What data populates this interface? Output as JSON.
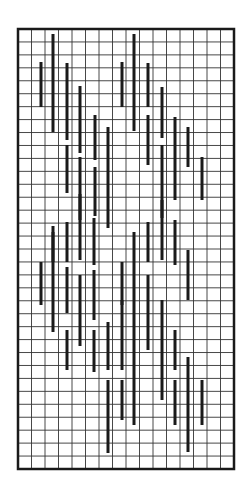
{
  "chart_data": {
    "type": "diagram",
    "title": "",
    "grid": {
      "x0": 18,
      "y0": 29,
      "x1": 234,
      "y1": 469,
      "columns": 16,
      "rows": 34,
      "line_color": "#333333",
      "border_color": "#1a1a1a"
    },
    "bar_color": "#1a1a1a",
    "bars": [
      {
        "x": 41,
        "y1": 62,
        "y2": 107
      },
      {
        "x": 53,
        "y1": 34,
        "y2": 132
      },
      {
        "x": 67,
        "y1": 63,
        "y2": 140
      },
      {
        "x": 67,
        "y1": 145,
        "y2": 193
      },
      {
        "x": 80,
        "y1": 86,
        "y2": 153
      },
      {
        "x": 80,
        "y1": 157,
        "y2": 220
      },
      {
        "x": 95,
        "y1": 115,
        "y2": 160
      },
      {
        "x": 95,
        "y1": 167,
        "y2": 216
      },
      {
        "x": 108,
        "y1": 127,
        "y2": 228
      },
      {
        "x": 122,
        "y1": 62,
        "y2": 107
      },
      {
        "x": 134,
        "y1": 34,
        "y2": 131
      },
      {
        "x": 148,
        "y1": 63,
        "y2": 107
      },
      {
        "x": 148,
        "y1": 115,
        "y2": 165
      },
      {
        "x": 162,
        "y1": 87,
        "y2": 138
      },
      {
        "x": 162,
        "y1": 145,
        "y2": 218
      },
      {
        "x": 175,
        "y1": 117,
        "y2": 200
      },
      {
        "x": 188,
        "y1": 127,
        "y2": 167
      },
      {
        "x": 202,
        "y1": 157,
        "y2": 200
      },
      {
        "x": 53,
        "y1": 226,
        "y2": 262
      },
      {
        "x": 67,
        "y1": 222,
        "y2": 262
      },
      {
        "x": 67,
        "y1": 267,
        "y2": 313
      },
      {
        "x": 80,
        "y1": 194,
        "y2": 260
      },
      {
        "x": 80,
        "y1": 275,
        "y2": 346
      },
      {
        "x": 94,
        "y1": 218,
        "y2": 265
      },
      {
        "x": 41,
        "y1": 262,
        "y2": 305
      },
      {
        "x": 53,
        "y1": 232,
        "y2": 332
      },
      {
        "x": 94,
        "y1": 330,
        "y2": 372
      },
      {
        "x": 108,
        "y1": 322,
        "y2": 370
      },
      {
        "x": 108,
        "y1": 380,
        "y2": 453
      },
      {
        "x": 122,
        "y1": 380,
        "y2": 420
      },
      {
        "x": 122,
        "y1": 262,
        "y2": 305
      },
      {
        "x": 134,
        "y1": 232,
        "y2": 330
      },
      {
        "x": 148,
        "y1": 222,
        "y2": 262
      },
      {
        "x": 148,
        "y1": 275,
        "y2": 350
      },
      {
        "x": 162,
        "y1": 200,
        "y2": 260
      },
      {
        "x": 162,
        "y1": 300,
        "y2": 400
      },
      {
        "x": 175,
        "y1": 220,
        "y2": 265
      },
      {
        "x": 175,
        "y1": 380,
        "y2": 425
      },
      {
        "x": 188,
        "y1": 357,
        "y2": 452
      },
      {
        "x": 202,
        "y1": 380,
        "y2": 425
      },
      {
        "x": 175,
        "y1": 330,
        "y2": 370
      },
      {
        "x": 188,
        "y1": 250,
        "y2": 300
      },
      {
        "x": 122,
        "y1": 300,
        "y2": 370
      },
      {
        "x": 94,
        "y1": 270,
        "y2": 320
      },
      {
        "x": 67,
        "y1": 330,
        "y2": 370
      },
      {
        "x": 134,
        "y1": 330,
        "y2": 425
      }
    ]
  }
}
